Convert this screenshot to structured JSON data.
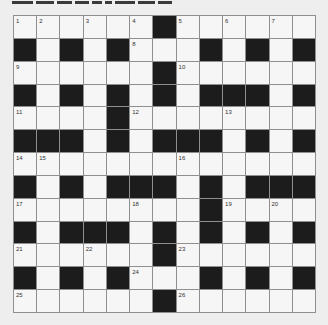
{
  "puzzle": {
    "title_clipped": true,
    "rows": 13,
    "cols": 13,
    "colors": {
      "background": "#eeeeee",
      "white_cell": "#f6f6f6",
      "black_cell": "#1c1c1c",
      "gridline": "#8f8f8f",
      "number": "#333333"
    },
    "layout": [
      "......#......",
      "#.#.#...#.#.#",
      "......#......",
      "#.#.#.#.###.#",
      "....#........",
      "###.#.###.#.#",
      ".............",
      "#.#.###.#.###",
      "........#....",
      "#.###.#.#.#.#",
      "......#......",
      "#.#.#...#.#.#",
      "......#......"
    ],
    "numbers": [
      {
        "r": 0,
        "c": 0,
        "n": "1"
      },
      {
        "r": 0,
        "c": 1,
        "n": "2"
      },
      {
        "r": 0,
        "c": 3,
        "n": "3"
      },
      {
        "r": 0,
        "c": 5,
        "n": "4"
      },
      {
        "r": 0,
        "c": 7,
        "n": "5"
      },
      {
        "r": 0,
        "c": 9,
        "n": "6"
      },
      {
        "r": 0,
        "c": 11,
        "n": "7"
      },
      {
        "r": 1,
        "c": 5,
        "n": "8"
      },
      {
        "r": 2,
        "c": 0,
        "n": "9"
      },
      {
        "r": 2,
        "c": 7,
        "n": "10"
      },
      {
        "r": 4,
        "c": 0,
        "n": "11"
      },
      {
        "r": 4,
        "c": 5,
        "n": "12"
      },
      {
        "r": 4,
        "c": 9,
        "n": "13"
      },
      {
        "r": 6,
        "c": 0,
        "n": "14"
      },
      {
        "r": 6,
        "c": 1,
        "n": "15"
      },
      {
        "r": 6,
        "c": 7,
        "n": "16"
      },
      {
        "r": 8,
        "c": 0,
        "n": "17"
      },
      {
        "r": 8,
        "c": 5,
        "n": "18"
      },
      {
        "r": 8,
        "c": 9,
        "n": "19"
      },
      {
        "r": 8,
        "c": 11,
        "n": "20"
      },
      {
        "r": 10,
        "c": 0,
        "n": "21"
      },
      {
        "r": 10,
        "c": 3,
        "n": "22"
      },
      {
        "r": 10,
        "c": 7,
        "n": "23"
      },
      {
        "r": 11,
        "c": 5,
        "n": "24"
      },
      {
        "r": 12,
        "c": 0,
        "n": "25"
      },
      {
        "r": 12,
        "c": 7,
        "n": "26"
      }
    ]
  }
}
